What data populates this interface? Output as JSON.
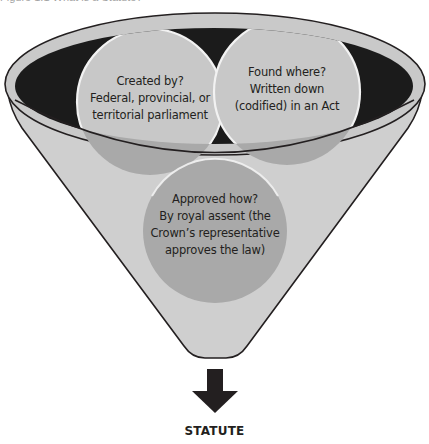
{
  "caption": {
    "text": "Figure 1.1 What is a Statute?"
  },
  "funnel": {
    "colors": {
      "rim_fill": "#c9c9c9",
      "rim_stroke": "#231f20",
      "interior": "#1b1b1b",
      "body_fill": "#cfcfcf",
      "circle_light": "#c8c8c8",
      "circle_mid": "#a9a9a9",
      "circle_outline": "#f2f2f2"
    },
    "circles": [
      {
        "id": "created-by",
        "lines": [
          "Created by?",
          "Federal, provincial, or",
          "territorial parliament"
        ]
      },
      {
        "id": "found-where",
        "lines": [
          "Found where?",
          "Written down",
          "(codified) in an Act"
        ]
      },
      {
        "id": "approved-how",
        "lines": [
          "Approved how?",
          "By royal assent (the",
          "Crown’s representative",
          "approves the law)"
        ]
      }
    ]
  },
  "arrow": {
    "icon": "arrow-down-icon",
    "color": "#231f20"
  },
  "result": {
    "label": "STATUTE"
  }
}
